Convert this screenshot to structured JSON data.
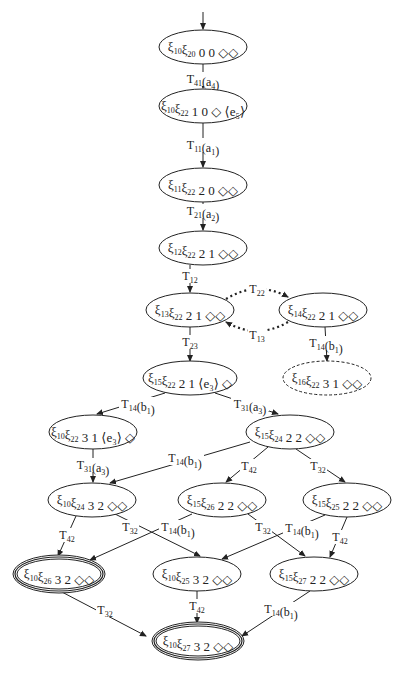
{
  "diagram": {
    "type": "state-transition-graph",
    "colors": {
      "stroke": "#222222",
      "background": "#ffffff"
    },
    "nodes": [
      {
        "id": "n1",
        "cx": 203,
        "cy": 47,
        "rx": 44,
        "ry": 17,
        "style": "solid",
        "parts": [
          [
            "ξ",
            "10"
          ],
          [
            "ξ",
            "20"
          ]
        ],
        "tail": "0 0  ◇◇"
      },
      {
        "id": "n2",
        "cx": 203,
        "cy": 106,
        "rx": 44,
        "ry": 17,
        "style": "solid",
        "parts": [
          [
            "ξ",
            "10"
          ],
          [
            "ξ",
            "22"
          ]
        ],
        "tail": "1 0  ◇ ⟨e₅⟩"
      },
      {
        "id": "n3",
        "cx": 203,
        "cy": 185,
        "rx": 44,
        "ry": 17,
        "style": "solid",
        "parts": [
          [
            "ξ",
            "11"
          ],
          [
            "ξ",
            "22"
          ]
        ],
        "tail": "2 0  ◇◇"
      },
      {
        "id": "n4",
        "cx": 203,
        "cy": 248,
        "rx": 44,
        "ry": 17,
        "style": "solid",
        "parts": [
          [
            "ξ",
            "12"
          ],
          [
            "ξ",
            "22"
          ]
        ],
        "tail": "2 1  ◇◇"
      },
      {
        "id": "n5",
        "cx": 190,
        "cy": 310,
        "rx": 44,
        "ry": 17,
        "style": "solid",
        "parts": [
          [
            "ξ",
            "13"
          ],
          [
            "ξ",
            "22"
          ]
        ],
        "tail": "2 1  ◇◇"
      },
      {
        "id": "n6",
        "cx": 323,
        "cy": 310,
        "rx": 44,
        "ry": 17,
        "style": "solid",
        "parts": [
          [
            "ξ",
            "14"
          ],
          [
            "ξ",
            "22"
          ]
        ],
        "tail": "2 1  ◇◇"
      },
      {
        "id": "n7",
        "cx": 190,
        "cy": 378,
        "rx": 47,
        "ry": 17,
        "style": "solid",
        "parts": [
          [
            "ξ",
            "15"
          ],
          [
            "ξ",
            "22"
          ]
        ],
        "tail": "2 1 ⟨e₃⟩ ◇"
      },
      {
        "id": "n8",
        "cx": 327,
        "cy": 378,
        "rx": 44,
        "ry": 17,
        "style": "dashed",
        "parts": [
          [
            "ξ",
            "16"
          ],
          [
            "ξ",
            "22"
          ]
        ],
        "tail": "3 1  ◇◇"
      },
      {
        "id": "n9",
        "cx": 93,
        "cy": 432,
        "rx": 44,
        "ry": 17,
        "style": "solid",
        "parts": [
          [
            "ξ",
            "10"
          ],
          [
            "ξ",
            "22"
          ]
        ],
        "tail": "3 1 ⟨e₃⟩ ◇"
      },
      {
        "id": "n10",
        "cx": 290,
        "cy": 432,
        "rx": 44,
        "ry": 17,
        "style": "solid",
        "parts": [
          [
            "ξ",
            "15"
          ],
          [
            "ξ",
            "24"
          ]
        ],
        "tail": "2 2  ◇◇"
      },
      {
        "id": "n11",
        "cx": 92,
        "cy": 500,
        "rx": 44,
        "ry": 17,
        "style": "solid",
        "parts": [
          [
            "ξ",
            "10"
          ],
          [
            "ξ",
            "24"
          ]
        ],
        "tail": "3 2  ◇◇"
      },
      {
        "id": "n12",
        "cx": 222,
        "cy": 500,
        "rx": 44,
        "ry": 17,
        "style": "solid",
        "parts": [
          [
            "ξ",
            "15"
          ],
          [
            "ξ",
            "26"
          ]
        ],
        "tail": "2 2  ◇◇"
      },
      {
        "id": "n13",
        "cx": 347,
        "cy": 500,
        "rx": 44,
        "ry": 17,
        "style": "solid",
        "parts": [
          [
            "ξ",
            "15"
          ],
          [
            "ξ",
            "25"
          ]
        ],
        "tail": "2 2  ◇◇"
      },
      {
        "id": "n14",
        "cx": 59,
        "cy": 574,
        "rx": 44,
        "ry": 17,
        "style": "double",
        "parts": [
          [
            "ξ",
            "10"
          ],
          [
            "ξ",
            "26"
          ]
        ],
        "tail": "3 2  ◇◇"
      },
      {
        "id": "n15",
        "cx": 197,
        "cy": 574,
        "rx": 44,
        "ry": 17,
        "style": "solid",
        "parts": [
          [
            "ξ",
            "10"
          ],
          [
            "ξ",
            "25"
          ]
        ],
        "tail": "3 2  ◇◇"
      },
      {
        "id": "n16",
        "cx": 314,
        "cy": 574,
        "rx": 44,
        "ry": 17,
        "style": "solid",
        "parts": [
          [
            "ξ",
            "15"
          ],
          [
            "ξ",
            "27"
          ]
        ],
        "tail": "2 2  ◇◇"
      },
      {
        "id": "n17",
        "cx": 198,
        "cy": 641,
        "rx": 44,
        "ry": 17,
        "style": "double",
        "parts": [
          [
            "ξ",
            "10"
          ],
          [
            "ξ",
            "27"
          ]
        ],
        "tail": "3 2  ◇◇"
      }
    ],
    "edges": [
      {
        "from": "start",
        "to": "n1",
        "x1": 203,
        "y1": 12,
        "x2": 203,
        "y2": 29,
        "style": "solid",
        "label": "",
        "lx": 0,
        "ly": 0
      },
      {
        "from": "n1",
        "to": "n2",
        "x1": 203,
        "y1": 64,
        "x2": 203,
        "y2": 88,
        "style": "solid",
        "label": [
          "T",
          "41",
          "(a",
          "4",
          ")"
        ],
        "lx": 203,
        "ly": 79
      },
      {
        "from": "n2",
        "to": "n3",
        "x1": 203,
        "y1": 123,
        "x2": 203,
        "y2": 167,
        "style": "solid",
        "label": [
          "T",
          "11",
          "(a",
          "1",
          ")"
        ],
        "lx": 203,
        "ly": 145
      },
      {
        "from": "n3",
        "to": "n4",
        "x1": 203,
        "y1": 202,
        "x2": 203,
        "y2": 230,
        "style": "solid",
        "label": [
          "T",
          "21",
          "(a",
          "2",
          ")"
        ],
        "lx": 203,
        "ly": 211
      },
      {
        "from": "n4",
        "to": "n5",
        "x1": 190,
        "y1": 265,
        "x2": 190,
        "y2": 292,
        "style": "solid",
        "label": [
          "T",
          "12",
          "",
          "",
          " "
        ],
        "lx": 190,
        "ly": 276
      },
      {
        "from": "n5",
        "to": "n6",
        "x1": 225,
        "y1": 299,
        "x2": 288,
        "y2": 297,
        "style": "dotted",
        "label": [
          "T",
          "22",
          "",
          "",
          " "
        ],
        "lx": 257,
        "ly": 289,
        "curve": "M226,299 Q257,280 288,297"
      },
      {
        "from": "n6",
        "to": "n5",
        "x1": 288,
        "y1": 322,
        "x2": 225,
        "y2": 322,
        "style": "dotted",
        "label": [
          "T",
          "13",
          "",
          "",
          " "
        ],
        "lx": 257,
        "ly": 335,
        "curve": "M288,322 Q257,340 226,322"
      },
      {
        "from": "n5",
        "to": "n7",
        "x1": 190,
        "y1": 327,
        "x2": 190,
        "y2": 361,
        "style": "solid",
        "label": [
          "T",
          "23",
          "",
          "",
          " "
        ],
        "lx": 190,
        "ly": 342
      },
      {
        "from": "n6",
        "to": "n8",
        "x1": 325,
        "y1": 327,
        "x2": 327,
        "y2": 361,
        "style": "solid",
        "label": [
          "T",
          "14",
          "(b",
          "1",
          ")"
        ],
        "lx": 326,
        "ly": 343
      },
      {
        "from": "n7",
        "to": "n9",
        "x1": 165,
        "y1": 393,
        "x2": 97,
        "y2": 414,
        "style": "solid",
        "label": [
          "T",
          "14",
          "(b",
          "1",
          ")"
        ],
        "lx": 138,
        "ly": 404
      },
      {
        "from": "n7",
        "to": "n10",
        "x1": 215,
        "y1": 393,
        "x2": 278,
        "y2": 414,
        "style": "solid",
        "label": [
          "T",
          "31",
          "(a",
          "3",
          ")"
        ],
        "lx": 250,
        "ly": 404
      },
      {
        "from": "n9",
        "to": "n11",
        "x1": 93,
        "y1": 449,
        "x2": 93,
        "y2": 482,
        "style": "solid",
        "label": [
          "T",
          "31",
          "(a",
          "3",
          ")"
        ],
        "lx": 93,
        "ly": 465
      },
      {
        "from": "n10",
        "to": "n11",
        "x1": 250,
        "y1": 442,
        "x2": 110,
        "y2": 483,
        "style": "solid",
        "label": [
          "T",
          "14",
          "(b",
          "1",
          ")"
        ],
        "lx": 185,
        "ly": 458
      },
      {
        "from": "n10",
        "to": "n12",
        "x1": 268,
        "y1": 447,
        "x2": 226,
        "y2": 482,
        "style": "solid",
        "label": [
          "T",
          "42",
          "",
          "",
          " "
        ],
        "lx": 249,
        "ly": 466
      },
      {
        "from": "n10",
        "to": "n13",
        "x1": 296,
        "y1": 449,
        "x2": 345,
        "y2": 482,
        "style": "solid",
        "label": [
          "T",
          "32",
          "",
          "",
          " "
        ],
        "lx": 318,
        "ly": 466
      },
      {
        "from": "n11",
        "to": "n14",
        "x1": 76,
        "y1": 516,
        "x2": 58,
        "y2": 556,
        "style": "solid",
        "label": [
          "T",
          "42",
          "",
          "",
          " "
        ],
        "lx": 67,
        "ly": 535
      },
      {
        "from": "n11",
        "to": "n15",
        "x1": 115,
        "y1": 514,
        "x2": 200,
        "y2": 556,
        "style": "solid",
        "label": [
          "T",
          "32",
          "",
          "",
          " "
        ],
        "lx": 130,
        "ly": 527
      },
      {
        "from": "n12",
        "to": "n14",
        "x1": 192,
        "y1": 514,
        "x2": 90,
        "y2": 560,
        "style": "solid",
        "label": [
          "T",
          "14",
          "(b",
          "1",
          ")"
        ],
        "lx": 178,
        "ly": 527
      },
      {
        "from": "n12",
        "to": "n16",
        "x1": 248,
        "y1": 514,
        "x2": 305,
        "y2": 556,
        "style": "solid",
        "label": [
          "T",
          "32",
          "",
          "",
          " "
        ],
        "lx": 263,
        "ly": 527
      },
      {
        "from": "n13",
        "to": "n15",
        "x1": 325,
        "y1": 515,
        "x2": 222,
        "y2": 559,
        "style": "solid",
        "label": [
          "T",
          "14",
          "(b",
          "1",
          ")"
        ],
        "lx": 302,
        "ly": 528
      },
      {
        "from": "n13",
        "to": "n16",
        "x1": 347,
        "y1": 517,
        "x2": 330,
        "y2": 557,
        "style": "solid",
        "label": [
          "T",
          "42",
          "",
          "",
          " "
        ],
        "lx": 340,
        "ly": 537
      },
      {
        "from": "n14",
        "to": "n17",
        "x1": 60,
        "y1": 591,
        "x2": 146,
        "y2": 636,
        "style": "solid",
        "label": [
          "T",
          "32",
          "",
          "",
          " "
        ],
        "lx": 105,
        "ly": 610
      },
      {
        "from": "n15",
        "to": "n17",
        "x1": 197,
        "y1": 591,
        "x2": 197,
        "y2": 623,
        "style": "solid",
        "label": [
          "T",
          "42",
          "",
          "",
          " "
        ],
        "lx": 197,
        "ly": 606
      },
      {
        "from": "n16",
        "to": "n17",
        "x1": 310,
        "y1": 591,
        "x2": 242,
        "y2": 636,
        "style": "solid",
        "label": [
          "T",
          "14",
          "(b",
          "1",
          ")"
        ],
        "lx": 281,
        "ly": 609
      }
    ]
  }
}
